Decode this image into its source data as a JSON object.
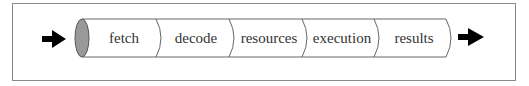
{
  "diagram": {
    "type": "pipeline",
    "stages": [
      {
        "label": "fetch"
      },
      {
        "label": "decode"
      },
      {
        "label": "resources"
      },
      {
        "label": "execution"
      },
      {
        "label": "results"
      }
    ],
    "input_arrow": "right-arrow-icon",
    "output_arrow": "right-arrow-icon",
    "colors": {
      "tube_end": "#999999",
      "stroke": "#555555",
      "arrow": "#000000",
      "frame": "#8a8a8a"
    }
  }
}
